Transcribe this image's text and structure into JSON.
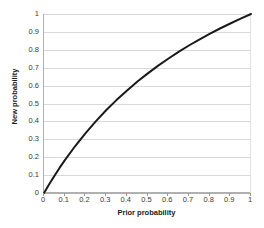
{
  "chart_data": {
    "type": "line",
    "title": "",
    "xlabel": "Prior probability",
    "ylabel": "New probability",
    "xlim": [
      0,
      1
    ],
    "ylim": [
      0,
      1
    ],
    "grid": "horizontal",
    "legend": "none",
    "xticks": [
      "0",
      "0.1",
      "0.2",
      "0.3",
      "0.4",
      "0.5",
      "0.6",
      "0.7",
      "0.8",
      "0.9",
      "1"
    ],
    "yticks": [
      "0",
      "0.1",
      "0.2",
      "0.3",
      "0.4",
      "0.5",
      "0.6",
      "0.7",
      "0.8",
      "0.9",
      "1"
    ],
    "xtick_values": [
      0,
      0.1,
      0.2,
      0.3,
      0.4,
      0.5,
      0.6,
      0.7,
      0.8,
      0.9,
      1
    ],
    "ytick_values": [
      0,
      0.1,
      0.2,
      0.3,
      0.4,
      0.5,
      0.6,
      0.7,
      0.8,
      0.9,
      1
    ],
    "series": [
      {
        "name": "New probability",
        "color": "#1a1a1a",
        "linewidth": 2,
        "x": [
          0,
          0.025,
          0.05,
          0.075,
          0.1,
          0.15,
          0.2,
          0.25,
          0.3,
          0.35,
          0.4,
          0.45,
          0.5,
          0.55,
          0.6,
          0.65,
          0.7,
          0.75,
          0.8,
          0.85,
          0.9,
          0.95,
          1
        ],
        "values": [
          0,
          0.049,
          0.095,
          0.14,
          0.182,
          0.261,
          0.333,
          0.4,
          0.462,
          0.519,
          0.571,
          0.621,
          0.667,
          0.71,
          0.75,
          0.788,
          0.824,
          0.857,
          0.889,
          0.919,
          0.947,
          0.974,
          1
        ]
      }
    ]
  },
  "axes": {
    "x_title": "Prior probability",
    "y_title": "New probability"
  },
  "colors": {
    "curve": "#1a1a1a",
    "gridline": "#d9d9d9",
    "axis": "#b0b0b0",
    "background": "#ffffff",
    "tick_text": "#3a3a3a"
  }
}
